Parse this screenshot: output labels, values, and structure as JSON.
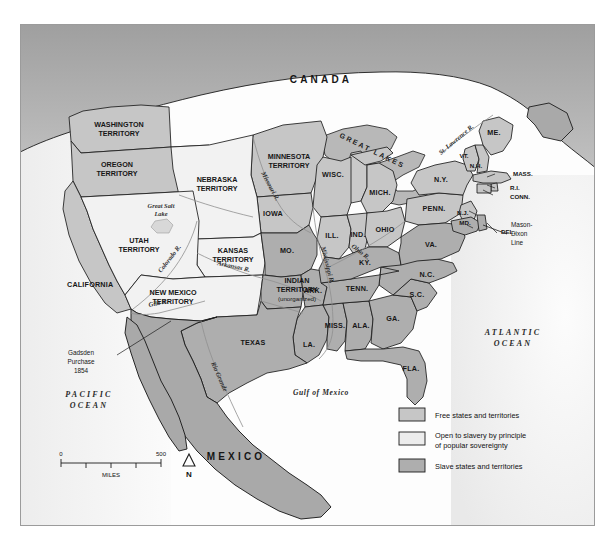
{
  "map": {
    "title_region": "United States 1854",
    "countries": [
      {
        "name": "CANADA",
        "x": 300,
        "y": 58
      },
      {
        "name": "MEXICO",
        "x": 215,
        "y": 435
      }
    ],
    "oceans": [
      {
        "name_line1": "PACIFIC",
        "name_line2": "OCEAN",
        "x": 68,
        "y": 372
      },
      {
        "name_line1": "ATLANTIC",
        "name_line2": "OCEAN",
        "x": 490,
        "y": 310
      },
      {
        "name": "Gulf of Mexico",
        "x": 300,
        "y": 370
      }
    ],
    "free_states": [
      {
        "label": "CALIFORNIA",
        "x": 46,
        "y": 262
      },
      {
        "label": "IOWA",
        "x": 252,
        "y": 191
      },
      {
        "label": "WISC.",
        "x": 312,
        "y": 152
      },
      {
        "label": "MICH.",
        "x": 359,
        "y": 170
      },
      {
        "label": "ILL.",
        "x": 293,
        "y": 213
      },
      {
        "label": "IND.",
        "x": 323,
        "y": 212
      },
      {
        "label": "OHIO",
        "x": 353,
        "y": 207
      },
      {
        "label": "PENN.",
        "x": 413,
        "y": 186
      },
      {
        "label": "N.Y.",
        "x": 412,
        "y": 157
      },
      {
        "label": "ME.",
        "x": 473,
        "y": 110
      },
      {
        "label": "VT.",
        "x": 447,
        "y": 132
      },
      {
        "label": "N.H.",
        "x": 457,
        "y": 140
      },
      {
        "label": "MASS.",
        "x": 476,
        "y": 150
      },
      {
        "label": "R.I.",
        "x": 477,
        "y": 163
      },
      {
        "label": "CONN.",
        "x": 476,
        "y": 171
      },
      {
        "label": "N.J.",
        "x": 450,
        "y": 185
      }
    ],
    "slave_states": [
      {
        "label": "MO.",
        "x": 255,
        "y": 226
      },
      {
        "label": "ARK.",
        "x": 265,
        "y": 278
      },
      {
        "label": "LA.",
        "x": 287,
        "y": 333
      },
      {
        "label": "MISS.",
        "x": 312,
        "y": 299
      },
      {
        "label": "ALA.",
        "x": 342,
        "y": 299
      },
      {
        "label": "GA.",
        "x": 378,
        "y": 293
      },
      {
        "label": "FLA.",
        "x": 396,
        "y": 346
      },
      {
        "label": "S.C.",
        "x": 400,
        "y": 270
      },
      {
        "label": "N.C.",
        "x": 410,
        "y": 249
      },
      {
        "label": "TENN.",
        "x": 340,
        "y": 265
      },
      {
        "label": "KY.",
        "x": 343,
        "y": 236
      },
      {
        "label": "VA.",
        "x": 408,
        "y": 224
      },
      {
        "label": "MD.",
        "x": 449,
        "y": 205
      },
      {
        "label": "DEL.",
        "x": 478,
        "y": 209
      },
      {
        "label": "TEXAS",
        "x": 232,
        "y": 320
      }
    ],
    "territories": [
      {
        "line1": "WASHINGTON",
        "line2": "TERRITORY",
        "x": 88,
        "y": 103,
        "type": "free"
      },
      {
        "line1": "OREGON",
        "line2": "TERRITORY",
        "x": 82,
        "y": 143,
        "type": "free"
      },
      {
        "line1": "MINNESOTA",
        "line2": "TERRITORY",
        "x": 272,
        "y": 135,
        "type": "free"
      },
      {
        "line1": "NEBRASKA",
        "line2": "TERRITORY",
        "x": 196,
        "y": 158,
        "type": "popular"
      },
      {
        "line1": "KANSAS",
        "line2": "TERRITORY",
        "x": 228,
        "y": 228,
        "type": "popular"
      },
      {
        "line1": "UTAH",
        "line2": "TERRITORY",
        "x": 118,
        "y": 219,
        "type": "popular"
      },
      {
        "line1": "NEW MEXICO",
        "line2": "TERRITORY",
        "x": 148,
        "y": 272,
        "type": "popular"
      },
      {
        "line1": "INDIAN",
        "line2": "TERRITORY",
        "line3": "(unorganized)",
        "x": 276,
        "y": 264,
        "type": "slave"
      }
    ],
    "rivers": [
      {
        "label": "Missouri R.",
        "x": 250,
        "y": 175
      },
      {
        "label": "Mississippi R.",
        "x": 298,
        "y": 240
      },
      {
        "label": "Ohio R.",
        "x": 335,
        "y": 228
      },
      {
        "label": "Arkansas R.",
        "x": 216,
        "y": 247
      },
      {
        "label": "Colorado R.",
        "x": 160,
        "y": 236
      },
      {
        "label": "Gila R.",
        "x": 138,
        "y": 287
      },
      {
        "label": "Rio Grande",
        "x": 198,
        "y": 367
      },
      {
        "label": "St. Lawrence R.",
        "x": 437,
        "y": 108
      }
    ],
    "water_features": [
      {
        "line1": "Great Salt",
        "line2": "Lake",
        "x": 140,
        "y": 187
      },
      {
        "label": "GREAT LAKES",
        "x": 350,
        "y": 120
      }
    ],
    "annotations": [
      {
        "line1": "Gadsden",
        "line2": "Purchase",
        "line3": "1854",
        "x": 60,
        "y": 341
      },
      {
        "line1": "Mason-",
        "line2": "Dixon",
        "line3": "Line",
        "x": 492,
        "y": 213
      }
    ]
  },
  "legend": {
    "items": [
      {
        "swatch_color": "#c6c6c6",
        "line1": "Free states and territories",
        "line2": ""
      },
      {
        "swatch_color": "#ececec",
        "line1": "Open to slavery by principle",
        "line2": "of popular sovereignty"
      },
      {
        "swatch_color": "#aeaeae",
        "line1": "Slave states and territories",
        "line2": ""
      }
    ]
  },
  "scale": {
    "min_label": "0",
    "max_label": "500",
    "units": "MILES",
    "north_label": "N"
  },
  "colors": {
    "free": "#c6c6c6",
    "popular": "#f2f2f2",
    "slave": "#aeaeae",
    "foreign": "#a9a9a9",
    "water": "#b8b8b8",
    "outline": "#1c1c1c",
    "thin_border": "#6f6f6f",
    "frame": "#9b9b9b",
    "background": "#fdfdfd"
  }
}
